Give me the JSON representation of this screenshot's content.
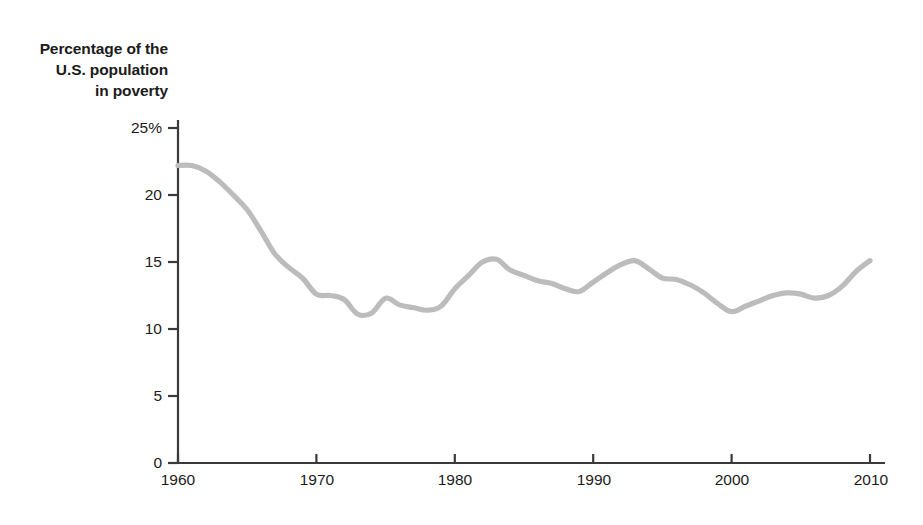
{
  "chart_data": {
    "type": "line",
    "title": "Percentage of the U.S. population in poverty",
    "title_lines": [
      "Percentage of the",
      "U.S. population",
      "in poverty"
    ],
    "xlabel": "",
    "ylabel": "",
    "xlim": [
      1960,
      2011
    ],
    "ylim": [
      0,
      25
    ],
    "grid": false,
    "legend": null,
    "line_color": "#bcbcbc",
    "axis_color": "#3a3a3a",
    "background_color": "#ffffff",
    "xticks": [
      1960,
      1970,
      1980,
      1990,
      2000,
      2010
    ],
    "xtick_labels": [
      "1960",
      "1970",
      "1980",
      "1990",
      "2000",
      "2010"
    ],
    "yticks": [
      0,
      5,
      10,
      15,
      20,
      25
    ],
    "ytick_labels": [
      "0",
      "5",
      "10",
      "15",
      "20",
      "25%"
    ],
    "series": [
      {
        "name": "Percentage of the U.S. population in poverty",
        "x": [
          1960,
          1961,
          1962,
          1963,
          1964,
          1965,
          1966,
          1967,
          1968,
          1969,
          1970,
          1971,
          1972,
          1973,
          1974,
          1975,
          1976,
          1977,
          1978,
          1979,
          1980,
          1981,
          1982,
          1983,
          1984,
          1985,
          1986,
          1987,
          1988,
          1989,
          1990,
          1991,
          1992,
          1993,
          1994,
          1995,
          1996,
          1997,
          1998,
          1999,
          2000,
          2001,
          2002,
          2003,
          2004,
          2005,
          2006,
          2007,
          2008,
          2009,
          2010
        ],
        "values": [
          22.2,
          22.2,
          21.8,
          21.0,
          20.0,
          18.9,
          17.3,
          15.6,
          14.6,
          13.8,
          12.6,
          12.5,
          12.2,
          11.1,
          11.2,
          12.3,
          11.8,
          11.6,
          11.4,
          11.7,
          13.0,
          14.0,
          15.0,
          15.2,
          14.4,
          14.0,
          13.6,
          13.4,
          13.0,
          12.8,
          13.5,
          14.2,
          14.8,
          15.1,
          14.5,
          13.8,
          13.7,
          13.3,
          12.7,
          11.9,
          11.3,
          11.7,
          12.1,
          12.5,
          12.7,
          12.6,
          12.3,
          12.5,
          13.2,
          14.3,
          15.1
        ]
      }
    ]
  }
}
